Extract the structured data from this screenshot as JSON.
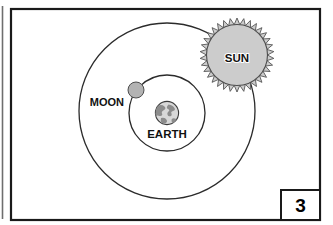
{
  "figure": {
    "caption_number": "3",
    "kind": "astronomy-diagram",
    "model": "geocentric"
  },
  "labels": {
    "sun": "SUN",
    "moon": "MOON",
    "earth": "EARTH"
  },
  "colors": {
    "frame_stroke": "#1a1a1a",
    "orbit_stroke": "#2b2b2b",
    "sun_fill": "#cccccc",
    "sun_stroke": "#4d4d4d",
    "moon_fill": "#b3b3b3",
    "moon_stroke": "#4d4d4d",
    "earth_ocean": "#d4d4d4",
    "earth_land": "#8f8f8f",
    "earth_stroke": "#3a3a3a",
    "background": "#ffffff",
    "text": "#111111"
  },
  "geometry": {
    "frame": {
      "x": 11,
      "y": 9,
      "width": 309,
      "height": 211
    },
    "left_edge_line": {
      "x": 2.5,
      "y1": 6,
      "y2": 219
    },
    "outer_orbit": {
      "cx": 167,
      "cy": 111,
      "r": 88
    },
    "inner_orbit": {
      "cx": 167,
      "cy": 113,
      "r": 38
    },
    "sun": {
      "cx": 237,
      "cy": 55,
      "r_body": 31,
      "r_spike": 37,
      "spikes": 34
    },
    "moon": {
      "cx": 136,
      "cy": 90,
      "r": 8
    },
    "earth": {
      "cx": 167,
      "cy": 113,
      "r": 12
    },
    "number_box": {
      "x": 281,
      "y": 190,
      "width": 39,
      "height": 30
    }
  },
  "label_positions": {
    "sun": {
      "x": 237,
      "y": 59
    },
    "moon": {
      "x": 113,
      "y": 103
    },
    "earth": {
      "x": 167,
      "y": 135
    },
    "number": {
      "x": 300.5,
      "y": 212
    }
  }
}
